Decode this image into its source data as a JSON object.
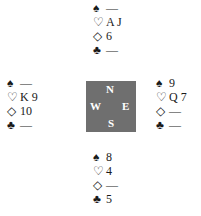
{
  "hands": {
    "north": {
      "spades": "—",
      "hearts": "A J",
      "diamonds": "6",
      "clubs": "—"
    },
    "west": {
      "spades": "—",
      "hearts": "K 9",
      "diamonds": "10",
      "clubs": "—"
    },
    "east": {
      "spades": "9",
      "hearts": "Q 7",
      "diamonds": "—",
      "clubs": "—"
    },
    "south": {
      "spades": "8",
      "hearts": "4",
      "diamonds": "—",
      "clubs": "5"
    }
  },
  "suits": {
    "spades": "♠",
    "hearts": "♡",
    "diamonds": "◇",
    "clubs": "♣"
  },
  "compass": {
    "n": "N",
    "w": "W",
    "e": "E",
    "s": "S",
    "color": "#6f6f6f"
  }
}
